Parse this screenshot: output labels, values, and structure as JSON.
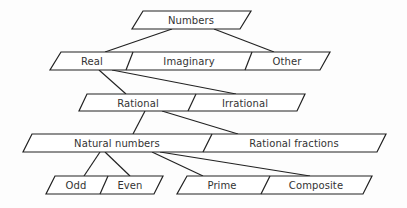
{
  "diagram": {
    "type": "taxonomy-tree",
    "colors": {
      "stroke": "#222222",
      "text": "#333333",
      "background": "#fdfdfd"
    },
    "nodes": {
      "numbers": "Numbers",
      "real": "Real",
      "imaginary": "Imaginary",
      "other": "Other",
      "rational": "Rational",
      "irrational": "Irrational",
      "natural": "Natural numbers",
      "rational_fractions": "Rational fractions",
      "odd": "Odd",
      "even": "Even",
      "prime": "Prime",
      "composite": "Composite"
    },
    "edges": [
      [
        "Numbers",
        "Real"
      ],
      [
        "Numbers",
        "Other"
      ],
      [
        "Real",
        "Rational"
      ],
      [
        "Real",
        "Irrational"
      ],
      [
        "Rational",
        "Natural numbers"
      ],
      [
        "Rational",
        "Rational fractions"
      ],
      [
        "Natural numbers",
        "Odd"
      ],
      [
        "Natural numbers",
        "Even"
      ],
      [
        "Natural numbers",
        "Prime"
      ],
      [
        "Natural numbers",
        "Composite"
      ]
    ]
  }
}
